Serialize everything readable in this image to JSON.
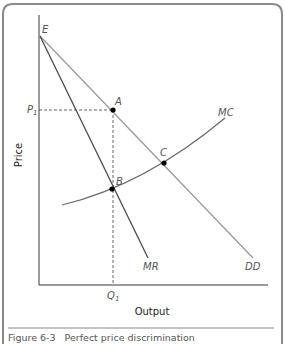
{
  "figure": {
    "caption_number": "Figure 6-3",
    "caption_title": "Perfect price discrimination",
    "x_axis_label": "Output",
    "y_axis_label": "Price"
  },
  "points": {
    "E": "E",
    "A": "A",
    "B": "B",
    "C": "C"
  },
  "curves": {
    "MC": "MC",
    "MR": "MR",
    "DD": "DD"
  },
  "ticks": {
    "price": "P",
    "price_sub": "1",
    "quantity": "Q",
    "quantity_sub": "1"
  },
  "colors": {
    "frame": "#8a8a8a",
    "axis": "#3a3a3a",
    "mr_line": "#4a4a4a",
    "dd_line": "#9a9a9a",
    "mc_line": "#6a6a6a",
    "dashed": "#555555",
    "point": "#000000",
    "label": "#555555"
  }
}
